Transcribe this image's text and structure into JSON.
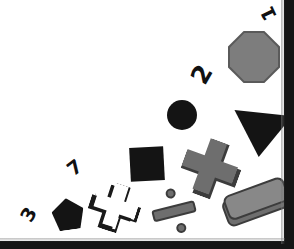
{
  "scene": {
    "background_color": "#151515",
    "paper_color": "#ffffff",
    "width": 294,
    "height": 249,
    "description": "Geometric shape arrangement puzzle on a white sheet"
  },
  "palette": {
    "black": "#141414",
    "gray_fill": "#6e6e6e",
    "gray_outline": "#3c3c3c",
    "octagon_gray": "#7d7d7d",
    "highlight_gray": "#888888",
    "white": "#ffffff"
  },
  "labels": [
    {
      "id": "label-1",
      "text": "1",
      "x": 262,
      "y": 4,
      "rotation": -115,
      "size": 19
    },
    {
      "id": "label-2",
      "text": "2",
      "x": 193,
      "y": 62,
      "rotation": -60,
      "size": 25
    },
    {
      "id": "label-7",
      "text": "7",
      "x": 68,
      "y": 158,
      "rotation": -38,
      "size": 19
    },
    {
      "id": "label-3",
      "text": "3",
      "x": 22,
      "y": 205,
      "rotation": -60,
      "size": 19
    }
  ],
  "shapes": [
    {
      "id": "octagon",
      "name": "gray-octagon",
      "x": 228,
      "y": 31,
      "rotation": 0,
      "fill": "#7d7d7d"
    },
    {
      "id": "triangle",
      "name": "black-triangle-down",
      "x": 232,
      "y": 113,
      "rotation": 6,
      "fill": "#141414"
    },
    {
      "id": "circle",
      "name": "black-circle",
      "x": 167,
      "y": 100,
      "rotation": 0,
      "fill": "#141414"
    },
    {
      "id": "square",
      "name": "black-square",
      "x": 130,
      "y": 147,
      "rotation": -3,
      "fill": "#141414"
    },
    {
      "id": "pentagon",
      "name": "black-pentagon",
      "x": 52,
      "y": 198,
      "rotation": -8,
      "fill": "#141414"
    },
    {
      "id": "cross-gray",
      "name": "gray-plus-cross",
      "x": 182,
      "y": 140,
      "rotation": 20,
      "fill": "#6e6e6e"
    },
    {
      "id": "cross-white",
      "name": "white-plus-cross",
      "x": 92,
      "y": 184,
      "rotation": 18,
      "fill": "#ffffff"
    },
    {
      "id": "division",
      "name": "gray-division-sign",
      "x": 150,
      "y": 188,
      "rotation": -14,
      "fill": "#6e6e6e"
    },
    {
      "id": "bar-block",
      "name": "gray-rounded-bar",
      "x": 223,
      "y": 190,
      "rotation": -20,
      "fill": "#6e6e6e"
    }
  ],
  "counts": {
    "total_shapes": 9,
    "total_labels": 4,
    "black_shapes": 4,
    "gray_shapes": 4,
    "white_shapes": 1
  }
}
